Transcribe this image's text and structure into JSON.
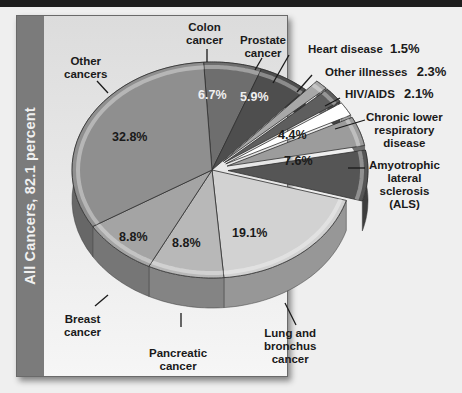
{
  "panel": {
    "band_label": "All Cancers, 82.1 percent"
  },
  "labels": {
    "colon": [
      "Colon",
      "cancer"
    ],
    "prostate": [
      "Prostate",
      "cancer"
    ],
    "other_cancers": [
      "Other",
      "cancers"
    ],
    "breast": [
      "Breast",
      "cancer"
    ],
    "pancreatic": [
      "Pancreatic",
      "cancer"
    ],
    "lung": [
      "Lung and",
      "bronchus",
      "cancer"
    ],
    "heart": "Heart disease",
    "other_ill": "Other illnesses",
    "hiv": "HIV/AIDS",
    "clrd": [
      "Chronic lower",
      "respiratory",
      "disease"
    ],
    "als": [
      "Amyotrophic",
      "lateral",
      "sclerosis",
      "(ALS)"
    ]
  },
  "values": {
    "colon": "6.7%",
    "prostate": "5.9%",
    "other_cancers": "32.8%",
    "breast": "8.8%",
    "pancreatic": "8.8%",
    "lung": "19.1%",
    "heart": "1.5%",
    "other_ill": "2.3%",
    "hiv": "2.1%",
    "clrd": "4.4%",
    "als": "7.6%"
  },
  "chart_data": {
    "type": "pie",
    "title": "",
    "group_label": "All Cancers, 82.1 percent",
    "categories": [
      "Colon cancer",
      "Prostate cancer",
      "Heart disease",
      "Other illnesses",
      "HIV/AIDS",
      "Chronic lower respiratory disease",
      "Amyotrophic lateral sclerosis (ALS)",
      "Lung and bronchus cancer",
      "Pancreatic cancer",
      "Breast cancer",
      "Other cancers"
    ],
    "values": [
      6.7,
      5.9,
      1.5,
      2.3,
      2.1,
      4.4,
      7.6,
      19.1,
      8.8,
      8.8,
      32.8
    ],
    "exploded": [
      "Heart disease",
      "Other illnesses",
      "HIV/AIDS",
      "Chronic lower respiratory disease",
      "Amyotrophic lateral sclerosis (ALS)"
    ],
    "groups": [
      {
        "name": "All Cancers",
        "total_percent": 82.1,
        "members": [
          "Colon cancer",
          "Prostate cancer",
          "Lung and bronchus cancer",
          "Pancreatic cancer",
          "Breast cancer",
          "Other cancers"
        ]
      }
    ],
    "style": "3D, grayscale",
    "legend": "none (direct labels)"
  },
  "colors": {
    "other_cancers": "#8f8f8f",
    "colon": "#6e6e6e",
    "prostate": "#4e4e4e",
    "heart": "#a8a8a8",
    "other_ill": "#5e5e5e",
    "hiv": "#ffffff",
    "clrd": "#9c9c9c",
    "als": "#555555",
    "lung": "#d2d2d2",
    "pancreatic": "#b8b8b8",
    "breast": "#a4a4a4",
    "band": "#7b7b7b"
  }
}
